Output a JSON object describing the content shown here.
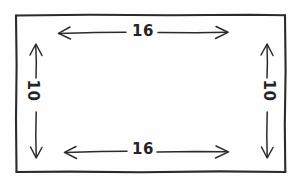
{
  "figure": {
    "type": "geometry-sketch",
    "style": "hand-drawn",
    "shape": "rectangle",
    "background_color": "#fefefe",
    "ink_color": "#2b2b2b"
  },
  "dimensions": {
    "top": {
      "value": "16",
      "orientation": "horizontal",
      "arrow": "double-headed",
      "position": "inside-top"
    },
    "bottom": {
      "value": "16",
      "orientation": "horizontal",
      "arrow": "double-headed",
      "position": "inside-bottom"
    },
    "left": {
      "value": "10",
      "orientation": "vertical",
      "arrow": "double-headed",
      "position": "inside-left",
      "text_rotation_deg": 90
    },
    "right": {
      "value": "10",
      "orientation": "vertical",
      "arrow": "double-headed",
      "position": "inside-right",
      "text_rotation_deg": 90
    }
  },
  "geometry": {
    "rect": {
      "x": 16,
      "y": 15,
      "width": 269,
      "height": 157
    },
    "top_arrow": {
      "x1": 58,
      "x2": 228,
      "y": 33
    },
    "bottom_arrow": {
      "x1": 64,
      "x2": 228,
      "y": 152
    },
    "left_arrow": {
      "x": 36,
      "y1": 44,
      "y2": 158
    },
    "right_arrow": {
      "x": 267,
      "y1": 44,
      "y2": 158
    }
  }
}
